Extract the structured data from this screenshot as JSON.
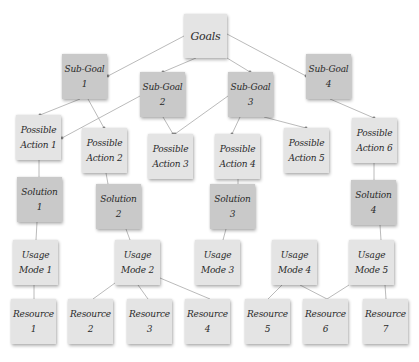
{
  "diagram": {
    "title": "Goals",
    "colors": {
      "light_box": "#e4e4e4",
      "dark_box": "#c9c9c9",
      "edge": "#a8a8a8",
      "text": "#2a2a2a"
    },
    "nodes": [
      {
        "id": "goals",
        "line1": "Goals",
        "line2": "",
        "x": 184,
        "y": 14,
        "w": 43,
        "h": 44,
        "shade": "light"
      },
      {
        "id": "subgoal1",
        "line1": "Sub-Goal",
        "line2": "1",
        "x": 62,
        "y": 54,
        "w": 45,
        "h": 45,
        "shade": "dark"
      },
      {
        "id": "subgoal2",
        "line1": "Sub-Goal",
        "line2": "2",
        "x": 140,
        "y": 72,
        "w": 45,
        "h": 45,
        "shade": "dark"
      },
      {
        "id": "subgoal3",
        "line1": "Sub-Goal",
        "line2": "3",
        "x": 228,
        "y": 72,
        "w": 45,
        "h": 45,
        "shade": "dark"
      },
      {
        "id": "subgoal4",
        "line1": "Sub-Goal",
        "line2": "4",
        "x": 306,
        "y": 54,
        "w": 45,
        "h": 45,
        "shade": "dark"
      },
      {
        "id": "action1",
        "line1": "Possible",
        "line2": "Action 1",
        "x": 16,
        "y": 115,
        "w": 45,
        "h": 45,
        "shade": "light"
      },
      {
        "id": "action2",
        "line1": "Possible",
        "line2": "Action 2",
        "x": 82,
        "y": 128,
        "w": 45,
        "h": 45,
        "shade": "light"
      },
      {
        "id": "action3",
        "line1": "Possible",
        "line2": "Action 3",
        "x": 148,
        "y": 134,
        "w": 45,
        "h": 45,
        "shade": "light"
      },
      {
        "id": "action4",
        "line1": "Possible",
        "line2": "Action 4",
        "x": 215,
        "y": 134,
        "w": 45,
        "h": 45,
        "shade": "light"
      },
      {
        "id": "action5",
        "line1": "Possible",
        "line2": "Action 5",
        "x": 284,
        "y": 128,
        "w": 45,
        "h": 45,
        "shade": "light"
      },
      {
        "id": "action6",
        "line1": "Possible",
        "line2": "Action 6",
        "x": 352,
        "y": 118,
        "w": 45,
        "h": 45,
        "shade": "light"
      },
      {
        "id": "solution1",
        "line1": "Solution",
        "line2": "1",
        "x": 17,
        "y": 177,
        "w": 45,
        "h": 45,
        "shade": "dark"
      },
      {
        "id": "solution2",
        "line1": "Solution",
        "line2": "2",
        "x": 96,
        "y": 184,
        "w": 45,
        "h": 45,
        "shade": "dark"
      },
      {
        "id": "solution3",
        "line1": "Solution",
        "line2": "3",
        "x": 210,
        "y": 184,
        "w": 45,
        "h": 45,
        "shade": "dark"
      },
      {
        "id": "solution4",
        "line1": "Solution",
        "line2": "4",
        "x": 351,
        "y": 180,
        "w": 45,
        "h": 45,
        "shade": "dark"
      },
      {
        "id": "usage1",
        "line1": "Usage",
        "line2": "Mode 1",
        "x": 13,
        "y": 240,
        "w": 45,
        "h": 45,
        "shade": "light"
      },
      {
        "id": "usage2",
        "line1": "Usage",
        "line2": "Mode 2",
        "x": 115,
        "y": 240,
        "w": 45,
        "h": 45,
        "shade": "light"
      },
      {
        "id": "usage3",
        "line1": "Usage",
        "line2": "Mode 3",
        "x": 195,
        "y": 240,
        "w": 45,
        "h": 45,
        "shade": "light"
      },
      {
        "id": "usage4",
        "line1": "Usage",
        "line2": "Mode 4",
        "x": 272,
        "y": 240,
        "w": 45,
        "h": 45,
        "shade": "light"
      },
      {
        "id": "usage5",
        "line1": "Usage",
        "line2": "Mode 5",
        "x": 349,
        "y": 240,
        "w": 45,
        "h": 45,
        "shade": "light"
      },
      {
        "id": "resource1",
        "line1": "Resource",
        "line2": "1",
        "x": 11,
        "y": 299,
        "w": 45,
        "h": 45,
        "shade": "light"
      },
      {
        "id": "resource2",
        "line1": "Resource",
        "line2": "2",
        "x": 68,
        "y": 299,
        "w": 45,
        "h": 45,
        "shade": "light"
      },
      {
        "id": "resource3",
        "line1": "Resource",
        "line2": "3",
        "x": 127,
        "y": 299,
        "w": 45,
        "h": 45,
        "shade": "light"
      },
      {
        "id": "resource4",
        "line1": "Resource",
        "line2": "4",
        "x": 185,
        "y": 299,
        "w": 45,
        "h": 45,
        "shade": "light"
      },
      {
        "id": "resource5",
        "line1": "Resource",
        "line2": "5",
        "x": 245,
        "y": 299,
        "w": 45,
        "h": 45,
        "shade": "light"
      },
      {
        "id": "resource6",
        "line1": "Resource",
        "line2": "6",
        "x": 303,
        "y": 299,
        "w": 45,
        "h": 45,
        "shade": "light"
      },
      {
        "id": "resource7",
        "line1": "Resource",
        "line2": "7",
        "x": 363,
        "y": 299,
        "w": 45,
        "h": 45,
        "shade": "light"
      }
    ],
    "edges": [
      {
        "from": [
          184,
          36
        ],
        "to": [
          108,
          76
        ],
        "arrow": true
      },
      {
        "from": [
          196,
          58
        ],
        "to": [
          163,
          72
        ],
        "arrow": true
      },
      {
        "from": [
          227,
          58
        ],
        "to": [
          250,
          72
        ],
        "arrow": true
      },
      {
        "from": [
          227,
          34
        ],
        "to": [
          306,
          76
        ],
        "arrow": true
      },
      {
        "from": [
          80,
          99
        ],
        "to": [
          40,
          115
        ],
        "arrow": true
      },
      {
        "from": [
          88,
          99
        ],
        "to": [
          104,
          128
        ],
        "arrow": true
      },
      {
        "from": [
          140,
          96
        ],
        "to": [
          62,
          138
        ],
        "arrow": true
      },
      {
        "from": [
          163,
          117
        ],
        "to": [
          173,
          134
        ],
        "arrow": true
      },
      {
        "from": [
          228,
          96
        ],
        "to": [
          175,
          134
        ],
        "arrow": true
      },
      {
        "from": [
          240,
          117
        ],
        "to": [
          232,
          134
        ],
        "arrow": true
      },
      {
        "from": [
          264,
          117
        ],
        "to": [
          306,
          128
        ],
        "arrow": true
      },
      {
        "from": [
          330,
          99
        ],
        "to": [
          374,
          118
        ],
        "arrow": true
      },
      {
        "from": [
          39,
          160
        ],
        "to": [
          39,
          177
        ],
        "arrow": false
      },
      {
        "from": [
          106,
          173
        ],
        "to": [
          108,
          184
        ],
        "arrow": false
      },
      {
        "from": [
          238,
          179
        ],
        "to": [
          238,
          184
        ],
        "arrow": false
      },
      {
        "from": [
          374,
          163
        ],
        "to": [
          374,
          180
        ],
        "arrow": false
      },
      {
        "from": [
          37,
          222
        ],
        "to": [
          36,
          240
        ],
        "arrow": false
      },
      {
        "from": [
          126,
          229
        ],
        "to": [
          130,
          240
        ],
        "arrow": false
      },
      {
        "from": [
          226,
          229
        ],
        "to": [
          223,
          240
        ],
        "arrow": false
      },
      {
        "from": [
          380,
          225
        ],
        "to": [
          381,
          240
        ],
        "arrow": false
      },
      {
        "from": [
          34,
          285
        ],
        "to": [
          34,
          299
        ],
        "arrow": false
      },
      {
        "from": [
          115,
          283
        ],
        "to": [
          93,
          299
        ],
        "arrow": false
      },
      {
        "from": [
          138,
          285
        ],
        "to": [
          148,
          299
        ],
        "arrow": false
      },
      {
        "from": [
          160,
          278
        ],
        "to": [
          210,
          299
        ],
        "arrow": false
      },
      {
        "from": [
          282,
          285
        ],
        "to": [
          268,
          299
        ],
        "arrow": false
      },
      {
        "from": [
          300,
          285
        ],
        "to": [
          327,
          299
        ],
        "arrow": false
      },
      {
        "from": [
          349,
          285
        ],
        "to": [
          327,
          299
        ],
        "arrow": false
      },
      {
        "from": [
          385,
          285
        ],
        "to": [
          386,
          299
        ],
        "arrow": false
      }
    ]
  }
}
